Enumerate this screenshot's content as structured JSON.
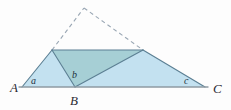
{
  "figure": {
    "background_color": "#fdfdfd",
    "width": 231,
    "height": 110
  },
  "palette": {
    "light_fill": "#c3e1f0",
    "dark_fill": "#a6cfd5",
    "stroke": "#5b7f93",
    "baseline_stroke": "#8f9aa3",
    "dashed_stroke": "#9aa7b4",
    "label_color": "#2b2b33"
  },
  "points": {
    "A": {
      "x": 22,
      "y": 87,
      "label": "A"
    },
    "B": {
      "x": 75,
      "y": 87,
      "label": "B"
    },
    "C": {
      "x": 205,
      "y": 87,
      "label": "C"
    },
    "D": {
      "x": 52,
      "y": 50,
      "label": ""
    },
    "E": {
      "x": 143,
      "y": 50,
      "label": ""
    },
    "F": {
      "x": 84,
      "y": 8,
      "label": ""
    }
  },
  "vertex_labels": [
    {
      "name": "A",
      "text": "A",
      "x": 10,
      "y": 92,
      "size": 13
    },
    {
      "name": "B",
      "text": "B",
      "x": 70,
      "y": 105,
      "size": 13
    },
    {
      "name": "C",
      "text": "C",
      "x": 213,
      "y": 93,
      "size": 13
    }
  ],
  "angle_labels": [
    {
      "name": "a",
      "text": "a",
      "x": 31,
      "y": 84,
      "size": 10
    },
    {
      "name": "b",
      "text": "b",
      "x": 72,
      "y": 78,
      "size": 10
    },
    {
      "name": "c",
      "text": "c",
      "x": 184,
      "y": 84,
      "size": 10
    }
  ],
  "regions": [
    {
      "name": "left-triangle",
      "polygon": "22,87 52,50 75,87",
      "fill": "#c3e1f0",
      "description": "Light blue triangle A-D-B"
    },
    {
      "name": "right-triangle",
      "polygon": "75,87 143,50 205,87",
      "fill": "#c3e1f0",
      "description": "Light blue triangle B-E-C"
    },
    {
      "name": "center-triangle",
      "polygon": "52,50 143,50 75,87",
      "fill": "#a6cfd5",
      "description": "Darker teal triangle D-E-B"
    }
  ],
  "solid_edges": [
    {
      "name": "edge-A-D",
      "x1": 22,
      "y1": 87,
      "x2": 52,
      "y2": 50
    },
    {
      "name": "edge-D-B",
      "x1": 52,
      "y1": 50,
      "x2": 75,
      "y2": 87
    },
    {
      "name": "edge-D-E",
      "x1": 52,
      "y1": 50,
      "x2": 143,
      "y2": 50
    },
    {
      "name": "edge-B-E",
      "x1": 75,
      "y1": 87,
      "x2": 143,
      "y2": 50
    },
    {
      "name": "edge-E-C",
      "x1": 143,
      "y1": 50,
      "x2": 205,
      "y2": 87
    }
  ],
  "baseline": {
    "name": "baseline-A-C",
    "x1": 19,
    "y1": 87,
    "x2": 208,
    "y2": 87
  },
  "dashed_edges": [
    {
      "name": "dashed-D-F",
      "x1": 52,
      "y1": 50,
      "x2": 84,
      "y2": 8
    },
    {
      "name": "dashed-F-E",
      "x1": 84,
      "y1": 8,
      "x2": 143,
      "y2": 50
    }
  ]
}
